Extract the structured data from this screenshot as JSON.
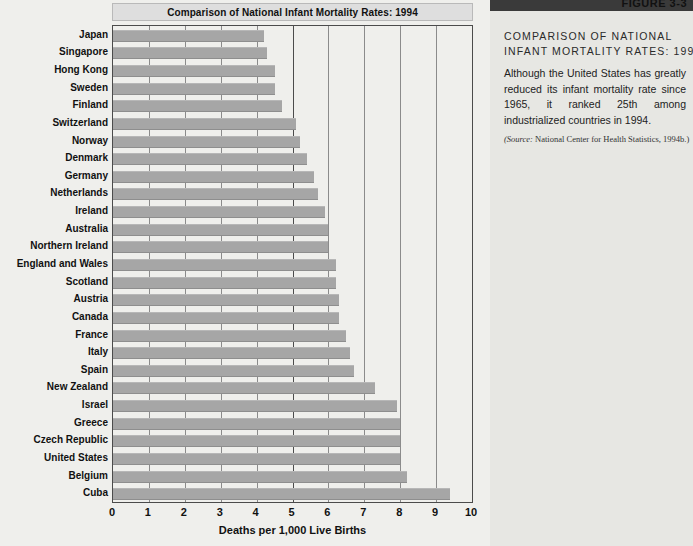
{
  "figure": {
    "number": "FIGURE 3-3",
    "heading_line1": "COMPARISON OF NATIONAL",
    "heading_line2": "INFANT MORTALITY RATES: 1994",
    "body": "Although the United States has greatly reduced its infant mortality rate since 1965, it ranked 25th among industrialized countries in 1994.",
    "source_prefix": "(Source:",
    "source_text": " National Center for Health Statistics, 1994b.)"
  },
  "chart_data": {
    "type": "bar",
    "orientation": "horizontal",
    "title": "Comparison of National Infant Mortality Rates: 1994",
    "xlabel": "Deaths per 1,000 Live Births",
    "ylabel": "",
    "xlim": [
      0,
      10
    ],
    "xticks": [
      0,
      1,
      2,
      3,
      4,
      5,
      6,
      7,
      8,
      9,
      10
    ],
    "xtick_labels": [
      "0",
      "1",
      "2",
      "3",
      "4",
      "5",
      "6",
      "7",
      "8",
      "9",
      "10"
    ],
    "grid": true,
    "legend": "none",
    "bar_color": "#a6a6a6",
    "categories": [
      "Japan",
      "Singapore",
      "Hong Kong",
      "Sweden",
      "Finland",
      "Switzerland",
      "Norway",
      "Denmark",
      "Germany",
      "Netherlands",
      "Ireland",
      "Australia",
      "Northern Ireland",
      "England and Wales",
      "Scotland",
      "Austria",
      "Canada",
      "France",
      "Italy",
      "Spain",
      "New Zealand",
      "Israel",
      "Greece",
      "Czech Republic",
      "United States",
      "Belgium",
      "Cuba"
    ],
    "values": [
      4.2,
      4.3,
      4.5,
      4.5,
      4.7,
      5.1,
      5.2,
      5.4,
      5.6,
      5.7,
      5.9,
      6.0,
      6.0,
      6.2,
      6.2,
      6.3,
      6.3,
      6.5,
      6.6,
      6.7,
      7.3,
      7.9,
      8.0,
      8.0,
      8.0,
      8.2,
      9.4
    ]
  }
}
